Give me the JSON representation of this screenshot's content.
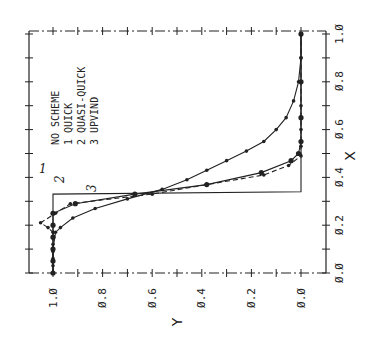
{
  "chart_data": {
    "type": "line",
    "orientation": "rotated 90 degrees counter-clockwise (X axis vertical on right, Y axis horizontal at bottom)",
    "title": "",
    "xlabel": "X",
    "ylabel": "Y",
    "xlim": [
      0.0,
      1.0
    ],
    "ylim": [
      0.0,
      1.0
    ],
    "x_ticks": [
      "0.0",
      "0.2",
      "0.4",
      "0.6",
      "0.8",
      "1.0"
    ],
    "y_ticks": [
      "1.0",
      "0.8",
      "0.6",
      "0.4",
      "0.2",
      "0.0"
    ],
    "x_tick_values": [
      0.0,
      0.2,
      0.4,
      0.6,
      0.8,
      1.0
    ],
    "y_tick_values": [
      1.0,
      0.8,
      0.6,
      0.4,
      0.2,
      0.0
    ],
    "grid": false,
    "legend": {
      "header": "NO SCHEME",
      "entries": [
        {
          "no": "1",
          "name": "QUICK"
        },
        {
          "no": "2",
          "name": "QUASI-QUICK"
        },
        {
          "no": "3",
          "name": "UPVIND"
        }
      ]
    },
    "annotations": [
      "1",
      "2",
      "3"
    ],
    "series": [
      {
        "name": "Exact (step)",
        "style": "solid",
        "x": [
          0.0,
          0.33,
          0.33,
          0.34,
          0.34,
          1.0
        ],
        "y": [
          1.0,
          1.0,
          1.0,
          0.0,
          0.0,
          0.0
        ]
      },
      {
        "name": "QUICK",
        "no": "1",
        "style": "dashed",
        "x": [
          0.0,
          0.03,
          0.06,
          0.09,
          0.12,
          0.15,
          0.17,
          0.19,
          0.21,
          0.25,
          0.29,
          0.33,
          0.37,
          0.41,
          0.45,
          0.49,
          0.53,
          0.6,
          0.7,
          0.8,
          0.9,
          1.0
        ],
        "y": [
          1.0,
          1.0,
          1.0,
          1.0,
          1.0,
          1.0,
          1.0,
          1.02,
          1.05,
          0.99,
          0.93,
          0.6,
          0.38,
          0.15,
          0.05,
          0.0,
          0.0,
          0.0,
          0.0,
          0.0,
          0.0,
          0.0
        ]
      },
      {
        "name": "QUASI-QUICK",
        "no": "2",
        "style": "solid",
        "x": [
          0.0,
          0.05,
          0.1,
          0.15,
          0.2,
          0.25,
          0.29,
          0.33,
          0.37,
          0.42,
          0.47,
          0.5,
          0.55,
          0.65,
          0.8,
          1.0
        ],
        "y": [
          1.0,
          1.0,
          1.0,
          1.0,
          1.0,
          1.0,
          0.91,
          0.67,
          0.38,
          0.16,
          0.04,
          0.01,
          0.0,
          0.0,
          0.0,
          0.0
        ]
      },
      {
        "name": "UPVIND",
        "no": "3",
        "style": "solid",
        "x": [
          0.0,
          0.1,
          0.17,
          0.19,
          0.23,
          0.27,
          0.31,
          0.35,
          0.39,
          0.43,
          0.47,
          0.51,
          0.55,
          0.6,
          0.65,
          0.72,
          0.8,
          0.9,
          1.0
        ],
        "y": [
          1.0,
          1.0,
          0.99,
          0.97,
          0.92,
          0.83,
          0.7,
          0.56,
          0.46,
          0.38,
          0.3,
          0.22,
          0.15,
          0.1,
          0.06,
          0.03,
          0.01,
          0.0,
          0.0
        ]
      }
    ]
  },
  "labels": {
    "x_axis_title": "X",
    "y_axis_title": "Y",
    "legend_header": "NO SCHEME",
    "legend_1": "1   QUICK",
    "legend_2": "2   QUASI-QUICK",
    "legend_3": "3   UPVIND",
    "anno_1": "1",
    "anno_2": "2",
    "anno_3": "3",
    "xt0": "Ø.Ø",
    "xt1": "Ø.2",
    "xt2": "Ø.4",
    "xt3": "Ø.6",
    "xt4": "Ø.8",
    "xt5": "1.Ø",
    "yt0": "1.Ø",
    "yt1": "Ø.8",
    "yt2": "Ø.6",
    "yt3": "Ø.4",
    "yt4": "Ø.2",
    "yt5": "Ø.Ø"
  }
}
